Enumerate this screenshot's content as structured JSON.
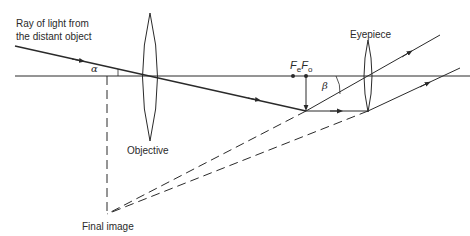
{
  "labels": {
    "ray_line1": "Ray of light from",
    "ray_line2": "the distant object",
    "alpha": "α",
    "beta": "β",
    "objective": "Objective",
    "eyepiece": "Eyepiece",
    "final_image": "Final image",
    "fe_main": "F",
    "fe_sub": "e",
    "fo_main": "F",
    "fo_sub": "o"
  },
  "colors": {
    "line": "#2a2a2a",
    "background": "#ffffff"
  }
}
